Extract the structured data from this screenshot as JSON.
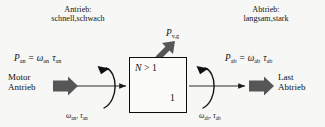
{
  "diagram": {
    "title_left": "Antrieb:",
    "subtitle_left": "schnell,schwach",
    "title_right": "Abtrieb:",
    "subtitle_right": "langsam,stark",
    "loss_power_symbol": "P",
    "loss_power_subscript": "v,g",
    "input_power_symbol": "P",
    "input_power_subscript": "an",
    "input_power_equation_omega": "ω",
    "input_power_equation_omega_sub": "an",
    "input_power_equation_tau": "τ",
    "input_power_equation_tau_sub": "an",
    "output_power_symbol": "P",
    "output_power_subscript": "ab",
    "output_power_equation_omega": "ω",
    "output_power_equation_omega_sub": "ab",
    "output_power_equation_tau": "τ",
    "output_power_equation_tau_sub": "ab",
    "equals_sign": "=",
    "source_line1": "Motor",
    "source_line2": "Antrieb",
    "sink_line1": "Last",
    "sink_line2": "Abtrieb",
    "gearbox_ratio_label": "N",
    "gearbox_ratio_operator": ">",
    "gearbox_ratio_value": "1",
    "gearbox_output_value": "1",
    "shaft_in_omega": "ω",
    "shaft_in_omega_sub": "an",
    "shaft_in_comma": ",",
    "shaft_in_tau": "τ",
    "shaft_in_tau_sub": "an",
    "shaft_out_omega": "ω",
    "shaft_out_omega_sub": "ab",
    "shaft_out_comma": ",",
    "shaft_out_tau": "τ",
    "shaft_out_tau_sub": "ab"
  },
  "colors": {
    "background": "#f7f7f5",
    "ink": "#111111",
    "block_arrow_fill": "#565656",
    "thin_line": "#2a2a2a",
    "box_stroke": "#0d0d0d"
  }
}
